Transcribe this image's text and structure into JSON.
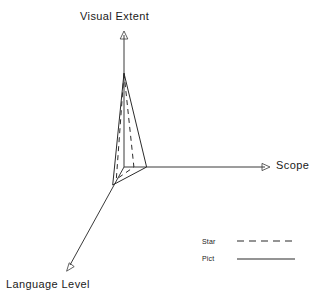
{
  "chart_data": {
    "type": "radar",
    "title": "",
    "axes": [
      {
        "name": "Visual Extent",
        "angle_deg": 90,
        "label": "Visual Extent"
      },
      {
        "name": "Scope",
        "angle_deg": 0,
        "label": "Scope"
      },
      {
        "name": "Language Level",
        "angle_deg": 238,
        "label": "Language Level"
      }
    ],
    "axis_max": 1.0,
    "grid": false,
    "legend_position": "bottom-right",
    "series": [
      {
        "name": "Star",
        "style": "dashed",
        "color": "#2b2b2b",
        "values": {
          "Visual Extent": 0.7,
          "Scope": 0.07,
          "Language Level": 0.13
        }
      },
      {
        "name": "Pict",
        "style": "solid",
        "color": "#2b2b2b",
        "values": {
          "Visual Extent": 0.7,
          "Scope": 0.16,
          "Language Level": 0.19
        }
      }
    ],
    "categories": [
      "Visual Extent",
      "Scope",
      "Language Level"
    ],
    "xlabel": "",
    "ylabel": ""
  },
  "labels": {
    "visual_extent": "Visual  Extent",
    "scope": "Scope",
    "language_level": "Language  Level"
  },
  "legend": {
    "items": [
      {
        "label": "Star",
        "style": "dashed"
      },
      {
        "label": "Pict",
        "style": "solid"
      }
    ]
  },
  "colors": {
    "axis": "#3a3a3a",
    "series": "#2b2b2b",
    "background": "#ffffff"
  }
}
